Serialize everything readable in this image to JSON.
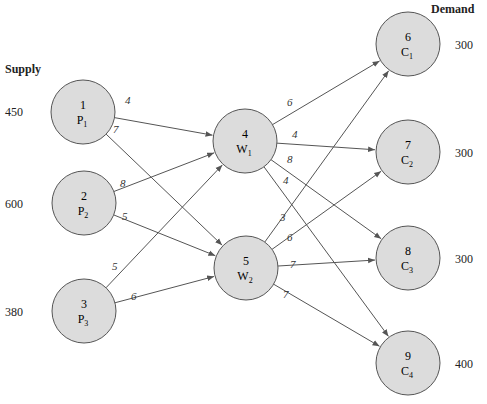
{
  "headers": {
    "supply": "Supply",
    "demand": "Demand"
  },
  "nodes": [
    {
      "id": "1",
      "label": "P",
      "sub": "1",
      "role": "plant",
      "cx": 83,
      "cy": 112,
      "qty": "450",
      "qx": 5,
      "qy": 115
    },
    {
      "id": "2",
      "label": "P",
      "sub": "2",
      "role": "plant",
      "cx": 84,
      "cy": 203,
      "qty": "600",
      "qx": 5,
      "qy": 207
    },
    {
      "id": "3",
      "label": "P",
      "sub": "3",
      "role": "plant",
      "cx": 84,
      "cy": 311,
      "qty": "380",
      "qx": 5,
      "qy": 315
    },
    {
      "id": "4",
      "label": "W",
      "sub": "1",
      "role": "warehouse",
      "cx": 245,
      "cy": 141
    },
    {
      "id": "5",
      "label": "W",
      "sub": "2",
      "role": "warehouse",
      "cx": 246,
      "cy": 268
    },
    {
      "id": "6",
      "label": "C",
      "sub": "1",
      "role": "customer",
      "cx": 408,
      "cy": 44,
      "qty": "300",
      "qx": 455,
      "qy": 48
    },
    {
      "id": "7",
      "label": "C",
      "sub": "2",
      "role": "customer",
      "cx": 408,
      "cy": 152,
      "qty": "300",
      "qx": 455,
      "qy": 156
    },
    {
      "id": "8",
      "label": "C",
      "sub": "3",
      "role": "customer",
      "cx": 408,
      "cy": 258,
      "qty": "300",
      "qx": 455,
      "qy": 262
    },
    {
      "id": "9",
      "label": "C",
      "sub": "4",
      "role": "customer",
      "cx": 408,
      "cy": 363,
      "qty": "400",
      "qx": 455,
      "qy": 367
    }
  ],
  "edges": [
    {
      "from": "1",
      "to": "4",
      "cost": "4",
      "lx": 125,
      "ly": 104
    },
    {
      "from": "1",
      "to": "5",
      "cost": "7",
      "lx": 113,
      "ly": 133
    },
    {
      "from": "2",
      "to": "4",
      "cost": "8",
      "lx": 120,
      "ly": 187
    },
    {
      "from": "2",
      "to": "5",
      "cost": "5",
      "lx": 122,
      "ly": 220
    },
    {
      "from": "3",
      "to": "4",
      "cost": "5",
      "lx": 112,
      "ly": 270
    },
    {
      "from": "3",
      "to": "5",
      "cost": "6",
      "lx": 131,
      "ly": 300
    },
    {
      "from": "4",
      "to": "6",
      "cost": "6",
      "lx": 287,
      "ly": 106
    },
    {
      "from": "4",
      "to": "7",
      "cost": "4",
      "lx": 292,
      "ly": 138
    },
    {
      "from": "4",
      "to": "8",
      "cost": "8",
      "lx": 287,
      "ly": 163
    },
    {
      "from": "4",
      "to": "9",
      "cost": "4",
      "lx": 283,
      "ly": 184
    },
    {
      "from": "5",
      "to": "6",
      "cost": "3",
      "lx": 280,
      "ly": 221
    },
    {
      "from": "5",
      "to": "7",
      "cost": "6",
      "lx": 287,
      "ly": 241
    },
    {
      "from": "5",
      "to": "8",
      "cost": "7",
      "lx": 290,
      "ly": 268
    },
    {
      "from": "5",
      "to": "9",
      "cost": "7",
      "lx": 283,
      "ly": 298
    }
  ],
  "style": {
    "node_fill": "#dcdcdc",
    "node_stroke": "#555555",
    "edge_color": "#555555",
    "radius": 32
  }
}
